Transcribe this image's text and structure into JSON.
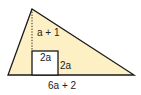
{
  "diagram": {
    "type": "geometry",
    "shape": "triangle-with-square-cutout",
    "colors": {
      "fill": "#fdf0c4",
      "stroke": "#1a1a1a",
      "square_fill": "#ffffff"
    },
    "labels": {
      "height_above_square": "a + 1",
      "square_top": "2a",
      "square_side": "2a",
      "base": "6a + 2"
    }
  }
}
